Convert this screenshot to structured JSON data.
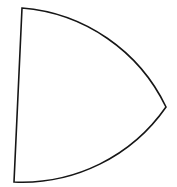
{
  "canvas": {
    "width": 177,
    "height": 187,
    "background": "#ffffff"
  },
  "shape": {
    "name": "curved-triangle",
    "description": "closed outline: straight left edge plus two outward-bulging circular arcs meeting at a sharp right vertex",
    "stroke_color": "#161616",
    "stroke_width": 1.6,
    "fill": "none",
    "linejoin": "miter",
    "vertices": {
      "top_left": {
        "x": 22,
        "y": 8
      },
      "right": {
        "x": 166,
        "y": 107
      },
      "bottom_left": {
        "x": 14,
        "y": 182
      }
    },
    "arc_radius": 175,
    "path": "M 22 8 A 175 175 0 0 1 166 107 A 175 175 0 0 1 14 182 Z",
    "viewbox": "0 0 177 187"
  }
}
